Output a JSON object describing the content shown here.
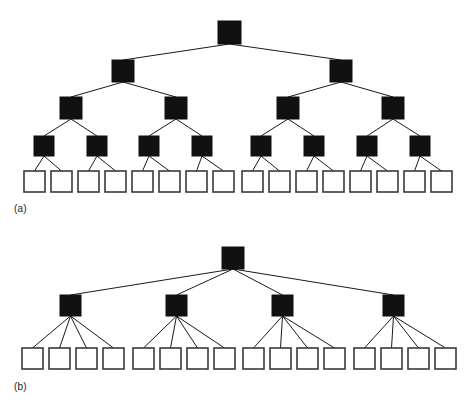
{
  "figure": {
    "background_color": "#ffffff",
    "node_fill_internal": "#111111",
    "node_fill_leaf": "#ffffff",
    "node_stroke": "#3a3a3a",
    "edge_color": "#1a1a1a",
    "edge_width": 1,
    "panels": [
      {
        "id": "a",
        "label": "(a)",
        "label_x": 14,
        "label_y": 203,
        "description": "balanced binary tree, depth 5",
        "levels": [
          {
            "name": "root",
            "type": "internal",
            "size": 23,
            "y": 21,
            "x": [
              218
            ]
          },
          {
            "name": "level-2",
            "type": "internal",
            "size": 22,
            "y": 60,
            "x": [
              112,
              330
            ]
          },
          {
            "name": "level-3",
            "type": "internal",
            "size": 22,
            "y": 97,
            "x": [
              60,
              165,
              277,
              382
            ]
          },
          {
            "name": "level-4",
            "type": "internal",
            "size": 20,
            "y": 136,
            "x": [
              34,
              87,
              139,
              192,
              251,
              304,
              357,
              410
            ]
          },
          {
            "name": "leaves",
            "type": "leaf",
            "size": 21,
            "y": 171,
            "x": [
              24,
              51,
              78,
              105,
              132,
              159,
              186,
              213,
              242,
              269,
              296,
              323,
              350,
              377,
              404,
              431
            ]
          }
        ],
        "edges": [
          [
            0,
            0,
            1,
            0
          ],
          [
            0,
            0,
            1,
            1
          ],
          [
            1,
            0,
            2,
            0
          ],
          [
            1,
            0,
            2,
            1
          ],
          [
            1,
            1,
            2,
            2
          ],
          [
            1,
            1,
            2,
            3
          ],
          [
            2,
            0,
            3,
            0
          ],
          [
            2,
            0,
            3,
            1
          ],
          [
            2,
            1,
            3,
            2
          ],
          [
            2,
            1,
            3,
            3
          ],
          [
            2,
            2,
            3,
            4
          ],
          [
            2,
            2,
            3,
            5
          ],
          [
            2,
            3,
            3,
            6
          ],
          [
            2,
            3,
            3,
            7
          ],
          [
            3,
            0,
            4,
            0
          ],
          [
            3,
            0,
            4,
            1
          ],
          [
            3,
            1,
            4,
            2
          ],
          [
            3,
            1,
            4,
            3
          ],
          [
            3,
            2,
            4,
            4
          ],
          [
            3,
            2,
            4,
            5
          ],
          [
            3,
            3,
            4,
            6
          ],
          [
            3,
            3,
            4,
            7
          ],
          [
            3,
            4,
            4,
            8
          ],
          [
            3,
            4,
            4,
            9
          ],
          [
            3,
            5,
            4,
            10
          ],
          [
            3,
            5,
            4,
            11
          ],
          [
            3,
            6,
            4,
            12
          ],
          [
            3,
            6,
            4,
            13
          ],
          [
            3,
            7,
            4,
            14
          ],
          [
            3,
            7,
            4,
            15
          ]
        ]
      },
      {
        "id": "b",
        "label": "(b)",
        "label_x": 14,
        "label_y": 381,
        "description": "shallow tree, depth 3, branching factor 4",
        "levels": [
          {
            "name": "root",
            "type": "internal",
            "size": 22,
            "y": 247,
            "x": [
              222
            ]
          },
          {
            "name": "level-2",
            "type": "internal",
            "size": 21,
            "y": 295,
            "x": [
              60,
              166,
              272,
              383
            ]
          },
          {
            "name": "leaves",
            "type": "leaf",
            "size": 21,
            "y": 348,
            "x": [
              22,
              49,
              76,
              103,
              133,
              160,
              187,
              214,
              243,
              270,
              297,
              324,
              354,
              381,
              408,
              435
            ]
          }
        ],
        "edges": [
          [
            0,
            0,
            1,
            0
          ],
          [
            0,
            0,
            1,
            1
          ],
          [
            0,
            0,
            1,
            2
          ],
          [
            0,
            0,
            1,
            3
          ],
          [
            1,
            0,
            2,
            0
          ],
          [
            1,
            0,
            2,
            1
          ],
          [
            1,
            0,
            2,
            2
          ],
          [
            1,
            0,
            2,
            3
          ],
          [
            1,
            1,
            2,
            4
          ],
          [
            1,
            1,
            2,
            5
          ],
          [
            1,
            1,
            2,
            6
          ],
          [
            1,
            1,
            2,
            7
          ],
          [
            1,
            2,
            2,
            8
          ],
          [
            1,
            2,
            2,
            9
          ],
          [
            1,
            2,
            2,
            10
          ],
          [
            1,
            2,
            2,
            11
          ],
          [
            1,
            3,
            2,
            12
          ],
          [
            1,
            3,
            2,
            13
          ],
          [
            1,
            3,
            2,
            14
          ],
          [
            1,
            3,
            2,
            15
          ]
        ]
      }
    ]
  }
}
